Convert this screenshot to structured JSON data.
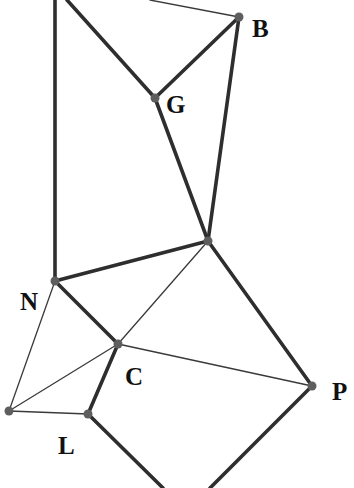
{
  "diagram": {
    "type": "geometric-figure",
    "vertices": [
      {
        "id": "B",
        "label": "B",
        "x": 239,
        "y": 17,
        "label_x": 252,
        "label_y": 37
      },
      {
        "id": "G",
        "label": "G",
        "x": 155,
        "y": 98,
        "label_x": 166,
        "label_y": 113
      },
      {
        "id": "M",
        "label": "",
        "x": 208,
        "y": 241
      },
      {
        "id": "N",
        "label": "N",
        "x": 55,
        "y": 281,
        "label_x": 20,
        "label_y": 310
      },
      {
        "id": "C",
        "label": "C",
        "x": 118,
        "y": 344,
        "label_x": 125,
        "label_y": 385
      },
      {
        "id": "P",
        "label": "P",
        "x": 312,
        "y": 386,
        "label_x": 332,
        "label_y": 400
      },
      {
        "id": "K",
        "label": "",
        "x": 9,
        "y": 411
      },
      {
        "id": "L",
        "label": "L",
        "x": 88,
        "y": 414,
        "label_x": 58,
        "label_y": 454
      }
    ],
    "offscreen_points": [
      {
        "id": "T1",
        "x": 55,
        "y": 0
      },
      {
        "id": "T2",
        "x": 67,
        "y": 0
      },
      {
        "id": "T3",
        "x": 150,
        "y": 0
      },
      {
        "id": "D1",
        "x": 163,
        "y": 488
      },
      {
        "id": "D2",
        "x": 210,
        "y": 488
      }
    ],
    "thick_edges": [
      [
        "T1",
        "N"
      ],
      [
        "T2",
        "G"
      ],
      [
        "G",
        "B"
      ],
      [
        "G",
        "M"
      ],
      [
        "B",
        "M"
      ],
      [
        "N",
        "M"
      ],
      [
        "N",
        "C"
      ],
      [
        "M",
        "P"
      ],
      [
        "C",
        "L"
      ],
      [
        "L",
        "D1"
      ],
      [
        "P",
        "D2"
      ]
    ],
    "thin_edges": [
      [
        "T3",
        "B"
      ],
      [
        "N",
        "K"
      ],
      [
        "K",
        "C"
      ],
      [
        "K",
        "L"
      ],
      [
        "C",
        "M"
      ],
      [
        "C",
        "P"
      ]
    ],
    "labels": [
      "B",
      "G",
      "N",
      "C",
      "P",
      "L"
    ]
  }
}
